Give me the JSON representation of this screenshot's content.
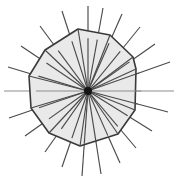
{
  "figure": {
    "type": "geometric-diagram",
    "canvas": {
      "width": 176,
      "height": 180,
      "background": "#ffffff"
    },
    "center": {
      "x": 88,
      "y": 91,
      "dot_radius": 4,
      "dot_color": "#141414"
    },
    "polygon": {
      "name": "convex-polygon",
      "sides": 11,
      "fill_color": "#e9e9e9",
      "stroke_color": "#3a3a3a",
      "stroke_width": 1.6,
      "vertices": [
        {
          "x": 78,
          "y": 29
        },
        {
          "x": 110,
          "y": 35
        },
        {
          "x": 133,
          "y": 57
        },
        {
          "x": 136,
          "y": 69
        },
        {
          "x": 135,
          "y": 110
        },
        {
          "x": 118,
          "y": 134
        },
        {
          "x": 80,
          "y": 146
        },
        {
          "x": 49,
          "y": 133
        },
        {
          "x": 31,
          "y": 108
        },
        {
          "x": 29,
          "y": 76
        },
        {
          "x": 45,
          "y": 50
        }
      ]
    },
    "rays": {
      "name": "radial-rays",
      "count": 22,
      "stroke_color": "#4a4a4a",
      "stroke_width": 1.15,
      "description": "Lines emanating from the central dot outward past the polygon boundary",
      "endpoints": [
        {
          "x": 88,
          "y": 6,
          "light": false
        },
        {
          "x": 103,
          "y": 8,
          "light": false
        },
        {
          "x": 122,
          "y": 14,
          "light": false
        },
        {
          "x": 140,
          "y": 27,
          "light": false
        },
        {
          "x": 155,
          "y": 44,
          "light": false
        },
        {
          "x": 170,
          "y": 62,
          "light": false
        },
        {
          "x": 174,
          "y": 91,
          "light": true
        },
        {
          "x": 168,
          "y": 112,
          "light": false
        },
        {
          "x": 152,
          "y": 131,
          "light": false
        },
        {
          "x": 136,
          "y": 148,
          "light": false
        },
        {
          "x": 120,
          "y": 163,
          "light": false
        },
        {
          "x": 101,
          "y": 174,
          "light": false
        },
        {
          "x": 82,
          "y": 176,
          "light": false
        },
        {
          "x": 62,
          "y": 167,
          "light": false
        },
        {
          "x": 45,
          "y": 152,
          "light": false
        },
        {
          "x": 25,
          "y": 136,
          "light": false
        },
        {
          "x": 9,
          "y": 118,
          "light": false
        },
        {
          "x": 4,
          "y": 91,
          "light": true
        },
        {
          "x": 8,
          "y": 67,
          "light": false
        },
        {
          "x": 21,
          "y": 46,
          "light": false
        },
        {
          "x": 40,
          "y": 26,
          "light": false
        },
        {
          "x": 62,
          "y": 11,
          "light": false
        }
      ]
    },
    "chords": {
      "name": "vertex-chords",
      "description": "Segments from the center to each polygon vertex forming triangular sectors"
    }
  }
}
